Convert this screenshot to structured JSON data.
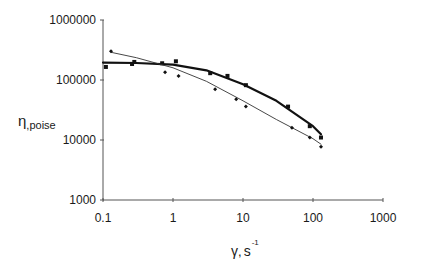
{
  "chart_data": {
    "type": "scatter",
    "title": "",
    "xlabel": "γ, s⁻¹",
    "xlabel_parts": {
      "symbol": "γ",
      "sep": ",",
      "unit": "s",
      "exp": "-1"
    },
    "ylabel": "η,poise",
    "ylabel_parts": {
      "symbol": "η",
      "sub": ",poise"
    },
    "xscale": "log",
    "yscale": "log",
    "xlim": [
      0.1,
      1000
    ],
    "ylim": [
      1000,
      1000000
    ],
    "x_ticks": [
      "0.1",
      "1",
      "10",
      "100",
      "1000"
    ],
    "y_ticks": [
      "1000",
      "10000",
      "100000",
      "1000000"
    ],
    "grid": false,
    "legend": null,
    "series": [
      {
        "name": "squares (bold fit line)",
        "marker": "square",
        "line": "bold",
        "points": [
          [
            0.11,
            165000
          ],
          [
            0.26,
            185000
          ],
          [
            0.28,
            200000
          ],
          [
            0.7,
            190000
          ],
          [
            1.1,
            205000
          ],
          [
            3.4,
            130000
          ],
          [
            6,
            117000
          ],
          [
            11,
            82000
          ],
          [
            44,
            36000
          ],
          [
            90,
            17000
          ],
          [
            130,
            11000
          ]
        ],
        "fit": [
          [
            0.1,
            195000
          ],
          [
            0.3,
            192000
          ],
          [
            1,
            180000
          ],
          [
            3,
            145000
          ],
          [
            10,
            85000
          ],
          [
            30,
            45000
          ],
          [
            100,
            17000
          ],
          [
            130,
            12500
          ]
        ]
      },
      {
        "name": "diamonds (thin fit line)",
        "marker": "diamond",
        "line": "thin",
        "points": [
          [
            0.13,
            300000
          ],
          [
            0.77,
            135000
          ],
          [
            1.2,
            117000
          ],
          [
            4,
            70000
          ],
          [
            8,
            48000
          ],
          [
            11,
            36000
          ],
          [
            50,
            16000
          ],
          [
            90,
            11000
          ],
          [
            130,
            7700
          ]
        ],
        "fit": [
          [
            0.13,
            290000
          ],
          [
            0.3,
            235000
          ],
          [
            1,
            160000
          ],
          [
            3,
            95000
          ],
          [
            10,
            45000
          ],
          [
            30,
            22000
          ],
          [
            100,
            10500
          ],
          [
            130,
            8500
          ]
        ]
      }
    ]
  },
  "colors": {
    "axis": "#555555",
    "series": "#111111",
    "thin_line": "#333333"
  }
}
